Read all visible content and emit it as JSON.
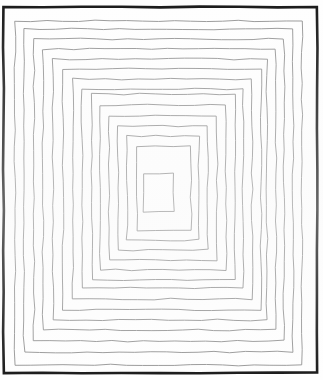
{
  "figure": {
    "background_color": "#fefefe",
    "outer_frame_color": "#1a1a1a",
    "ring_color": "#8d8d8d",
    "inner_square_fill": "#ffffff",
    "canvas_width": 323,
    "canvas_height": 380,
    "ring_count": 15,
    "outer_frame_stroke_width": 2.6,
    "ring_stroke_width": 0.9,
    "jitter_amplitude": 0.9
  },
  "chart_data": {
    "type": "line",
    "xlabel": "",
    "ylabel": "",
    "xlim": [
      0,
      323
    ],
    "ylim": [
      0,
      380
    ],
    "grid": false,
    "legend_position": "none",
    "annotations": [],
    "outer_frame": {
      "left": 3.5,
      "top": 7.0,
      "right": 317.0,
      "bottom": 373.0
    },
    "rings": [
      {
        "index": 1,
        "left": 15,
        "top": 21,
        "right": 302,
        "bottom": 365
      },
      {
        "index": 2,
        "left": 24,
        "top": 29,
        "right": 293,
        "bottom": 352
      },
      {
        "index": 3,
        "left": 34,
        "top": 39,
        "right": 284,
        "bottom": 341
      },
      {
        "index": 4,
        "left": 43,
        "top": 49,
        "right": 276,
        "bottom": 330
      },
      {
        "index": 5,
        "left": 53,
        "top": 59,
        "right": 267,
        "bottom": 320
      },
      {
        "index": 6,
        "left": 63,
        "top": 69,
        "right": 261,
        "bottom": 310
      },
      {
        "index": 7,
        "left": 73,
        "top": 79,
        "right": 252,
        "bottom": 299
      },
      {
        "index": 8,
        "left": 82,
        "top": 89,
        "right": 243,
        "bottom": 288
      },
      {
        "index": 9,
        "left": 92,
        "top": 94,
        "right": 235,
        "bottom": 280
      },
      {
        "index": 10,
        "left": 100,
        "top": 105,
        "right": 226,
        "bottom": 270
      },
      {
        "index": 11,
        "left": 109,
        "top": 116,
        "right": 217,
        "bottom": 260
      },
      {
        "index": 12,
        "left": 118,
        "top": 126,
        "right": 208,
        "bottom": 250
      },
      {
        "index": 13,
        "left": 127,
        "top": 136,
        "right": 199,
        "bottom": 240
      },
      {
        "index": 14,
        "left": 137,
        "top": 146,
        "right": 191,
        "bottom": 231
      },
      {
        "index": 15,
        "left": 144,
        "top": 173,
        "right": 174,
        "bottom": 212
      }
    ]
  }
}
